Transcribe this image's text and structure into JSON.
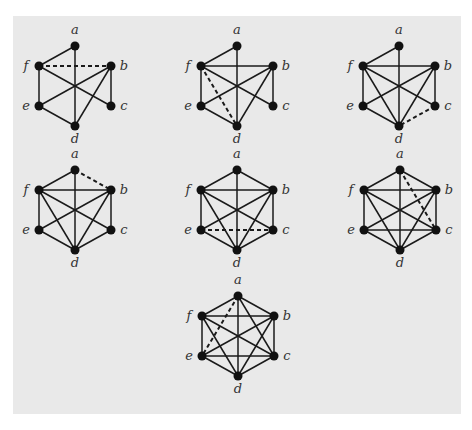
{
  "colors": {
    "background": "#ffffff",
    "panel": "#e9e9e9",
    "edge": "#1a1a1a",
    "node": "#111111",
    "label": "#333333"
  },
  "node_offsets": {
    "a": [
      0,
      -20
    ],
    "f": [
      -36,
      0
    ],
    "b": [
      36,
      0
    ],
    "e": [
      -36,
      40
    ],
    "c": [
      36,
      40
    ],
    "d": [
      0,
      60
    ]
  },
  "graphs": [
    {
      "id": "g1",
      "origin": [
        75,
        66
      ],
      "edges": [
        [
          "a",
          "f"
        ],
        [
          "a",
          "d"
        ],
        [
          "f",
          "e"
        ],
        [
          "f",
          "c"
        ],
        [
          "b",
          "e"
        ],
        [
          "b",
          "d"
        ],
        [
          "b",
          "c"
        ],
        [
          "e",
          "d"
        ]
      ],
      "dashed": [
        [
          "f",
          "b"
        ]
      ]
    },
    {
      "id": "g2",
      "origin": [
        237,
        66
      ],
      "edges": [
        [
          "a",
          "f"
        ],
        [
          "a",
          "d"
        ],
        [
          "f",
          "b"
        ],
        [
          "f",
          "e"
        ],
        [
          "f",
          "c"
        ],
        [
          "b",
          "e"
        ],
        [
          "b",
          "d"
        ],
        [
          "b",
          "c"
        ],
        [
          "e",
          "d"
        ]
      ],
      "dashed": [
        [
          "f",
          "d"
        ]
      ]
    },
    {
      "id": "g3",
      "origin": [
        399,
        66
      ],
      "edges": [
        [
          "a",
          "f"
        ],
        [
          "a",
          "d"
        ],
        [
          "f",
          "b"
        ],
        [
          "f",
          "e"
        ],
        [
          "f",
          "c"
        ],
        [
          "f",
          "d"
        ],
        [
          "b",
          "e"
        ],
        [
          "b",
          "d"
        ],
        [
          "b",
          "c"
        ],
        [
          "e",
          "d"
        ]
      ],
      "dashed": [
        [
          "c",
          "d"
        ]
      ]
    },
    {
      "id": "g4",
      "origin": [
        75,
        190
      ],
      "edges": [
        [
          "a",
          "f"
        ],
        [
          "a",
          "d"
        ],
        [
          "f",
          "b"
        ],
        [
          "f",
          "e"
        ],
        [
          "f",
          "c"
        ],
        [
          "f",
          "d"
        ],
        [
          "b",
          "e"
        ],
        [
          "b",
          "d"
        ],
        [
          "b",
          "c"
        ],
        [
          "e",
          "d"
        ],
        [
          "c",
          "d"
        ]
      ],
      "dashed": [
        [
          "a",
          "b"
        ]
      ]
    },
    {
      "id": "g5",
      "origin": [
        237,
        190
      ],
      "edges": [
        [
          "a",
          "f"
        ],
        [
          "a",
          "d"
        ],
        [
          "a",
          "b"
        ],
        [
          "f",
          "b"
        ],
        [
          "f",
          "e"
        ],
        [
          "f",
          "c"
        ],
        [
          "f",
          "d"
        ],
        [
          "b",
          "e"
        ],
        [
          "b",
          "d"
        ],
        [
          "b",
          "c"
        ],
        [
          "e",
          "d"
        ],
        [
          "c",
          "d"
        ]
      ],
      "dashed": [
        [
          "e",
          "c"
        ]
      ]
    },
    {
      "id": "g6",
      "origin": [
        400,
        190
      ],
      "edges": [
        [
          "a",
          "f"
        ],
        [
          "a",
          "d"
        ],
        [
          "a",
          "b"
        ],
        [
          "f",
          "b"
        ],
        [
          "f",
          "e"
        ],
        [
          "f",
          "c"
        ],
        [
          "f",
          "d"
        ],
        [
          "b",
          "e"
        ],
        [
          "b",
          "d"
        ],
        [
          "b",
          "c"
        ],
        [
          "e",
          "d"
        ],
        [
          "c",
          "d"
        ],
        [
          "e",
          "c"
        ]
      ],
      "dashed": [
        [
          "a",
          "c"
        ]
      ]
    },
    {
      "id": "g7",
      "origin": [
        238,
        316
      ],
      "edges": [
        [
          "a",
          "f"
        ],
        [
          "a",
          "d"
        ],
        [
          "a",
          "b"
        ],
        [
          "a",
          "c"
        ],
        [
          "f",
          "b"
        ],
        [
          "f",
          "e"
        ],
        [
          "f",
          "c"
        ],
        [
          "f",
          "d"
        ],
        [
          "b",
          "e"
        ],
        [
          "b",
          "d"
        ],
        [
          "b",
          "c"
        ],
        [
          "e",
          "d"
        ],
        [
          "c",
          "d"
        ],
        [
          "e",
          "c"
        ]
      ],
      "dashed": [
        [
          "a",
          "e"
        ]
      ]
    }
  ],
  "labels": [
    "a",
    "b",
    "c",
    "d",
    "e",
    "f"
  ]
}
